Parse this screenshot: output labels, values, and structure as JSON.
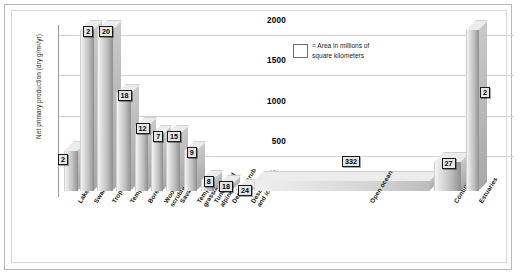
{
  "figure": {
    "border_color": "#b9b9b9",
    "background": "#ffffff",
    "accent": "#8f8f8f"
  },
  "axis": {
    "ytitle": "Net primary production (dry g/m²/yr)",
    "yticks": [
      "500",
      "1000",
      "1500",
      "2000"
    ]
  },
  "legend": {
    "swatch": "legend-swatch",
    "line1": "= Area in millions of",
    "line2": "square kilometers"
  },
  "chart_data": {
    "type": "bar",
    "title": "",
    "xlabel": "",
    "ylabel": "Net primary production (dry g/m²/yr)",
    "ylim": [
      0,
      2100
    ],
    "yticks": [
      500,
      1000,
      1500,
      2000
    ],
    "grid": true,
    "legend_position": "upper-center",
    "legend_entries": [
      "= Area in millions of square kilometers"
    ],
    "value_label_meaning": "Area in millions of square kilometers",
    "categories": [
      "Lake and stream",
      "Swamp and marsh",
      "Tropical forest",
      "Temperate forest",
      "Boreal forest",
      "Woodland and scrubland",
      "Savanna",
      "Temperate grassland",
      "Tundra and alpine",
      "Desert scrub",
      "Desert, rock, and ice",
      "Open ocean",
      "Continental shelf",
      "Estuaries"
    ],
    "series": [
      {
        "name": "Net primary production (dry g/m²/yr)",
        "values": [
          500,
          2000,
          2000,
          1200,
          800,
          700,
          700,
          500,
          140,
          70,
          3,
          125,
          360,
          2000
        ]
      },
      {
        "name": "Area in millions of square kilometers",
        "values": [
          2,
          2,
          20,
          18,
          12,
          7,
          15,
          9,
          8,
          18,
          24,
          332,
          27,
          2
        ]
      }
    ],
    "bars": [
      {
        "label": "Lake and stream",
        "production": 500,
        "area": 2,
        "area_text": "2"
      },
      {
        "label": "Swamp and marsh",
        "production": 2000,
        "area": 2,
        "area_text": "2"
      },
      {
        "label": "Tropical forest",
        "production": 2000,
        "area": 20,
        "area_text": "20"
      },
      {
        "label": "Temperate forest",
        "production": 1200,
        "area": 18,
        "area_text": "18"
      },
      {
        "label": "Boreal forest",
        "production": 800,
        "area": 12,
        "area_text": "12"
      },
      {
        "label": "Woodland and scrubland",
        "production": 700,
        "area": 7,
        "area_text": "7"
      },
      {
        "label": "Savanna",
        "production": 700,
        "area": 15,
        "area_text": "15"
      },
      {
        "label": "Temperate grassland",
        "production": 500,
        "area": 9,
        "area_text": "9"
      },
      {
        "label": "Tundra and alpine",
        "production": 140,
        "area": 8,
        "area_text": "8"
      },
      {
        "label": "Desert scrub",
        "production": 70,
        "area": 18,
        "area_text": "18"
      },
      {
        "label": "Desert, rock, and ice",
        "production": 3,
        "area": 24,
        "area_text": "24"
      },
      {
        "label": "Open ocean",
        "production": 125,
        "area": 332,
        "area_text": "332"
      },
      {
        "label": "Continental shelf",
        "production": 360,
        "area": 27,
        "area_text": "27"
      },
      {
        "label": "Estuaries",
        "production": 2000,
        "area": 2,
        "area_text": "2"
      }
    ]
  },
  "category_labels": [
    {
      "lines": [
        "Lake and stream"
      ]
    },
    {
      "lines": [
        "Swamp and marsh"
      ]
    },
    {
      "lines": [
        "Tropical forest"
      ]
    },
    {
      "lines": [
        "Temperate forest"
      ]
    },
    {
      "lines": [
        "Boreal forest"
      ]
    },
    {
      "lines": [
        "Woodland and",
        "scrubland"
      ]
    },
    {
      "lines": [
        "Savanna"
      ]
    },
    {
      "lines": [
        "Temperate",
        "grassland"
      ]
    },
    {
      "lines": [
        "Tundra and",
        "alpine"
      ]
    },
    {
      "lines": [
        "Desert scrub"
      ]
    },
    {
      "lines": [
        "Desert, rock,",
        "and ice"
      ]
    },
    {
      "lines": [
        "Open ocean"
      ]
    },
    {
      "lines": [
        "Continental shelf"
      ]
    },
    {
      "lines": [
        "Estuaries"
      ]
    }
  ]
}
